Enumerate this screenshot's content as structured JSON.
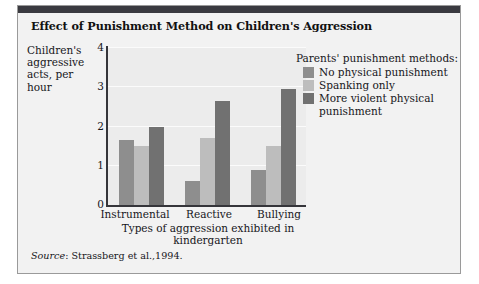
{
  "figure": {
    "title": "Effect of Punishment Method on Children's Aggression",
    "source_prefix": "Source",
    "source_text": ": Strassberg et al.,1994."
  },
  "legend": {
    "title": "Parents' punishment methods:",
    "entries": [
      {
        "label": "No physical punishment",
        "color": "#8e8e8e"
      },
      {
        "label": "Spanking only",
        "color": "#bdbdbd"
      },
      {
        "label": "More violent physical punishment",
        "color": "#717171"
      }
    ]
  },
  "chart_data": {
    "type": "bar",
    "title": "Effect of Punishment Method on Children's Aggression",
    "xlabel": "Types of aggression exhibited in kindergarten",
    "ylabel": "Children's aggressive acts, per hour",
    "categories": [
      "Instrumental",
      "Reactive",
      "Bullying"
    ],
    "series": [
      {
        "name": "No physical punishment",
        "color": "#8e8e8e",
        "values": [
          1.65,
          0.6,
          0.9
        ]
      },
      {
        "name": "Spanking only",
        "color": "#bdbdbd",
        "values": [
          1.5,
          1.7,
          1.5
        ]
      },
      {
        "name": "More violent physical punishment",
        "color": "#717171",
        "values": [
          2.0,
          2.65,
          2.95
        ]
      }
    ],
    "ylim": [
      0,
      4
    ],
    "yticks": [
      0,
      1,
      2,
      3,
      4
    ],
    "ytick_labels": [
      "0",
      "1",
      "2",
      "3",
      "4"
    ],
    "grid": true,
    "legend_position": "right"
  }
}
